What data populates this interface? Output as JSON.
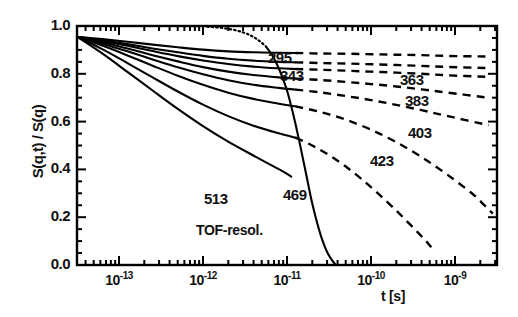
{
  "figure": {
    "ylabel": "S(q,t) / S(q)",
    "xlabel": "t [s]",
    "tof_label": "TOF-resol."
  },
  "yticks": [
    {
      "label": "1.0",
      "value": 1.0
    },
    {
      "label": "0.8",
      "value": 0.8
    },
    {
      "label": "0.6",
      "value": 0.6
    },
    {
      "label": "0.4",
      "value": 0.4
    },
    {
      "label": "0.2",
      "value": 0.2
    },
    {
      "label": "0.0",
      "value": 0.0
    }
  ],
  "xticks": [
    {
      "mantissa": "10",
      "exponent": "-13",
      "value": -13
    },
    {
      "mantissa": "10",
      "exponent": "-12",
      "value": -12
    },
    {
      "mantissa": "10",
      "exponent": "-11",
      "value": -11
    },
    {
      "mantissa": "10",
      "exponent": "-10",
      "value": -10
    },
    {
      "mantissa": "10",
      "exponent": "-9",
      "value": -9
    }
  ],
  "curve_labels": [
    {
      "text": "295",
      "x": 268,
      "y": 49
    },
    {
      "text": "343",
      "x": 280,
      "y": 67
    },
    {
      "text": "363",
      "x": 400,
      "y": 71
    },
    {
      "text": "383",
      "x": 405,
      "y": 92
    },
    {
      "text": "403",
      "x": 408,
      "y": 124
    },
    {
      "text": "423",
      "x": 370,
      "y": 152
    },
    {
      "text": "469",
      "x": 283,
      "y": 186
    },
    {
      "text": "513",
      "x": 204,
      "y": 190
    }
  ],
  "chart_data": {
    "type": "line",
    "title": "",
    "xlabel": "t [s]",
    "ylabel": "S(q,t) / S(q)",
    "xscale": "log",
    "xlim": [
      3.1622776601683796e-14,
      3.1622776601683795e-09
    ],
    "ylim": [
      0.0,
      1.0
    ],
    "grid": false,
    "legend": "inline-curve-labels",
    "x_tick_values": [
      1e-13,
      1e-12,
      1e-11,
      1e-10,
      1e-09
    ],
    "y_tick_values": [
      0.0,
      0.2,
      0.4,
      0.6,
      0.8,
      1.0
    ],
    "series": [
      {
        "name": "295",
        "temperature_K": 295,
        "solid_points": [
          [
            -13.5,
            0.955
          ],
          [
            -13.2,
            0.945
          ],
          [
            -12.9,
            0.934
          ],
          [
            -12.6,
            0.922
          ],
          [
            -12.3,
            0.911
          ],
          [
            -12.0,
            0.901
          ],
          [
            -11.7,
            0.894
          ],
          [
            -11.4,
            0.89
          ],
          [
            -11.1,
            0.888
          ],
          [
            -10.9,
            0.887
          ]
        ],
        "dashed_points": [
          [
            -10.9,
            0.887
          ],
          [
            -10.6,
            0.885
          ],
          [
            -10.3,
            0.884
          ],
          [
            -10.0,
            0.882
          ],
          [
            -9.7,
            0.88
          ],
          [
            -9.4,
            0.878
          ],
          [
            -9.1,
            0.875
          ],
          [
            -8.6,
            0.872
          ]
        ]
      },
      {
        "name": "343",
        "temperature_K": 343,
        "solid_points": [
          [
            -13.5,
            0.955
          ],
          [
            -13.2,
            0.94
          ],
          [
            -12.9,
            0.924
          ],
          [
            -12.6,
            0.906
          ],
          [
            -12.3,
            0.89
          ],
          [
            -12.0,
            0.875
          ],
          [
            -11.7,
            0.863
          ],
          [
            -11.4,
            0.855
          ],
          [
            -11.1,
            0.85
          ],
          [
            -10.9,
            0.848
          ]
        ],
        "dashed_points": [
          [
            -10.9,
            0.848
          ],
          [
            -10.6,
            0.845
          ],
          [
            -10.3,
            0.843
          ],
          [
            -10.0,
            0.84
          ],
          [
            -9.7,
            0.837
          ],
          [
            -9.4,
            0.833
          ],
          [
            -9.1,
            0.829
          ],
          [
            -8.6,
            0.824
          ]
        ]
      },
      {
        "name": "363",
        "temperature_K": 363,
        "solid_points": [
          [
            -13.5,
            0.955
          ],
          [
            -13.2,
            0.937
          ],
          [
            -12.9,
            0.917
          ],
          [
            -12.6,
            0.895
          ],
          [
            -12.3,
            0.874
          ],
          [
            -12.0,
            0.856
          ],
          [
            -11.7,
            0.841
          ],
          [
            -11.4,
            0.83
          ],
          [
            -11.1,
            0.823
          ],
          [
            -10.9,
            0.82
          ]
        ],
        "dashed_points": [
          [
            -10.9,
            0.82
          ],
          [
            -10.6,
            0.817
          ],
          [
            -10.3,
            0.813
          ],
          [
            -10.0,
            0.809
          ],
          [
            -9.7,
            0.805
          ],
          [
            -9.4,
            0.8
          ],
          [
            -9.1,
            0.794
          ],
          [
            -8.6,
            0.787
          ]
        ]
      },
      {
        "name": "383",
        "temperature_K": 383,
        "solid_points": [
          [
            -13.5,
            0.955
          ],
          [
            -13.2,
            0.932
          ],
          [
            -12.9,
            0.906
          ],
          [
            -12.6,
            0.878
          ],
          [
            -12.3,
            0.852
          ],
          [
            -12.0,
            0.828
          ],
          [
            -11.7,
            0.809
          ],
          [
            -11.4,
            0.795
          ],
          [
            -11.1,
            0.785
          ],
          [
            -10.9,
            0.78
          ]
        ],
        "dashed_points": [
          [
            -10.9,
            0.78
          ],
          [
            -10.6,
            0.774
          ],
          [
            -10.3,
            0.766
          ],
          [
            -10.0,
            0.757
          ],
          [
            -9.7,
            0.747
          ],
          [
            -9.4,
            0.735
          ],
          [
            -9.1,
            0.722
          ],
          [
            -8.6,
            0.7
          ]
        ]
      },
      {
        "name": "403",
        "temperature_K": 403,
        "solid_points": [
          [
            -13.5,
            0.955
          ],
          [
            -13.2,
            0.926
          ],
          [
            -12.9,
            0.894
          ],
          [
            -12.6,
            0.86
          ],
          [
            -12.3,
            0.827
          ],
          [
            -12.0,
            0.798
          ],
          [
            -11.7,
            0.773
          ],
          [
            -11.4,
            0.754
          ],
          [
            -11.1,
            0.741
          ],
          [
            -10.9,
            0.734
          ]
        ],
        "dashed_points": [
          [
            -10.9,
            0.734
          ],
          [
            -10.6,
            0.722
          ],
          [
            -10.3,
            0.707
          ],
          [
            -10.0,
            0.69
          ],
          [
            -9.7,
            0.67
          ],
          [
            -9.4,
            0.648
          ],
          [
            -9.1,
            0.624
          ],
          [
            -8.6,
            0.585
          ]
        ]
      },
      {
        "name": "423",
        "temperature_K": 423,
        "solid_points": [
          [
            -13.5,
            0.955
          ],
          [
            -13.2,
            0.918
          ],
          [
            -12.9,
            0.877
          ],
          [
            -12.6,
            0.834
          ],
          [
            -12.3,
            0.792
          ],
          [
            -12.0,
            0.754
          ],
          [
            -11.7,
            0.721
          ],
          [
            -11.4,
            0.695
          ],
          [
            -11.1,
            0.675
          ],
          [
            -10.9,
            0.664
          ]
        ],
        "dashed_points": [
          [
            -10.9,
            0.664
          ],
          [
            -10.6,
            0.64
          ],
          [
            -10.3,
            0.608
          ],
          [
            -10.0,
            0.566
          ],
          [
            -9.7,
            0.514
          ],
          [
            -9.4,
            0.452
          ],
          [
            -9.1,
            0.38
          ],
          [
            -8.8,
            0.3
          ],
          [
            -8.65,
            0.25
          ],
          [
            -8.55,
            0.215
          ]
        ]
      },
      {
        "name": "469",
        "temperature_K": 469,
        "solid_points": [
          [
            -13.5,
            0.955
          ],
          [
            -13.2,
            0.903
          ],
          [
            -12.9,
            0.845
          ],
          [
            -12.6,
            0.785
          ],
          [
            -12.3,
            0.726
          ],
          [
            -12.0,
            0.671
          ],
          [
            -11.7,
            0.623
          ],
          [
            -11.4,
            0.583
          ],
          [
            -11.1,
            0.551
          ],
          [
            -10.9,
            0.533
          ]
        ],
        "dashed_points": [
          [
            -10.9,
            0.533
          ],
          [
            -10.7,
            0.5
          ],
          [
            -10.5,
            0.46
          ],
          [
            -10.3,
            0.412
          ],
          [
            -10.1,
            0.356
          ],
          [
            -9.9,
            0.294
          ],
          [
            -9.7,
            0.228
          ],
          [
            -9.55,
            0.175
          ],
          [
            -9.42,
            0.128
          ],
          [
            -9.32,
            0.09
          ],
          [
            -9.25,
            0.06
          ]
        ]
      },
      {
        "name": "513",
        "temperature_K": 513,
        "solid_points": [
          [
            -13.5,
            0.955
          ],
          [
            -13.2,
            0.885
          ],
          [
            -12.9,
            0.808
          ],
          [
            -12.6,
            0.73
          ],
          [
            -12.3,
            0.653
          ],
          [
            -12.0,
            0.581
          ],
          [
            -11.7,
            0.516
          ],
          [
            -11.4,
            0.458
          ],
          [
            -11.2,
            0.42
          ],
          [
            -11.05,
            0.392
          ],
          [
            -10.95,
            0.37
          ]
        ],
        "dashed_points": []
      },
      {
        "name": "TOF-resol.",
        "resolution_function": true,
        "style": "mixed-dotted-solid",
        "dotted_points": [
          [
            -11.95,
            0.997
          ],
          [
            -11.8,
            0.993
          ],
          [
            -11.65,
            0.985
          ],
          [
            -11.52,
            0.973
          ],
          [
            -11.42,
            0.958
          ],
          [
            -11.33,
            0.938
          ],
          [
            -11.25,
            0.914
          ]
        ],
        "solid_points": [
          [
            -11.25,
            0.914
          ],
          [
            -11.18,
            0.88
          ],
          [
            -11.12,
            0.84
          ],
          [
            -11.06,
            0.79
          ],
          [
            -11.0,
            0.73
          ],
          [
            -10.95,
            0.665
          ],
          [
            -10.9,
            0.592
          ],
          [
            -10.85,
            0.512
          ],
          [
            -10.8,
            0.428
          ],
          [
            -10.75,
            0.342
          ],
          [
            -10.7,
            0.258
          ],
          [
            -10.64,
            0.175
          ],
          [
            -10.58,
            0.105
          ],
          [
            -10.52,
            0.052
          ],
          [
            -10.46,
            0.018
          ],
          [
            -10.42,
            0.0
          ]
        ]
      }
    ]
  }
}
